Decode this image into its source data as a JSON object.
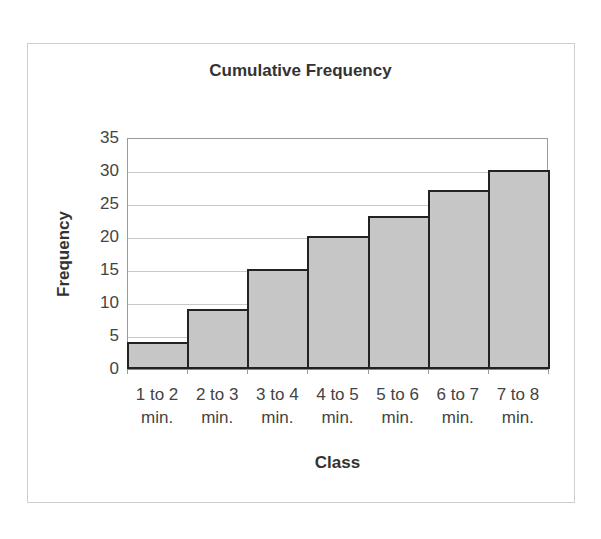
{
  "chart_data": {
    "type": "bar",
    "title": "Cumulative Frequency",
    "xlabel": "Class",
    "ylabel": "Frequency",
    "categories": [
      "1 to 2 min.",
      "2 to 3 min.",
      "3 to 4 min.",
      "4 to 5 min.",
      "5 to 6 min.",
      "6 to 7 min.",
      "7 to 8 min."
    ],
    "category_lines": [
      [
        "1 to 2",
        "min."
      ],
      [
        "2 to 3",
        "min."
      ],
      [
        "3 to 4",
        "min."
      ],
      [
        "4 to 5",
        "min."
      ],
      [
        "5 to 6",
        "min."
      ],
      [
        "6 to 7",
        "min."
      ],
      [
        "7 to 8",
        "min."
      ]
    ],
    "values": [
      4,
      9,
      15,
      20,
      23,
      27,
      30
    ],
    "ylim": [
      0,
      35
    ],
    "yticks": [
      0,
      5,
      10,
      15,
      20,
      25,
      30,
      35
    ],
    "grid": true,
    "legend": null,
    "bar_color": "#c6c6c6",
    "bar_edge_color": "#222222",
    "bar_gap": 0
  }
}
